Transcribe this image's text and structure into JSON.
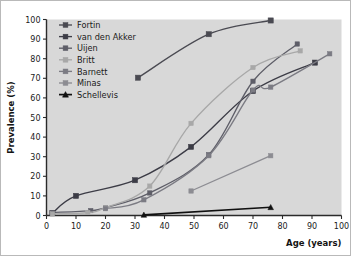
{
  "chart_data": {
    "type": "line",
    "title": "",
    "xlabel": "Age (years)",
    "ylabel": "Prevalence (%)",
    "xlim": [
      0,
      100
    ],
    "ylim": [
      0,
      100
    ],
    "xticks": [
      0,
      10,
      20,
      30,
      40,
      50,
      60,
      70,
      80,
      90,
      100
    ],
    "yticks": [
      0,
      10,
      20,
      30,
      40,
      50,
      60,
      70,
      80,
      90,
      100
    ],
    "grid": false,
    "legend_position": "top-left-inside",
    "plot_background": "#d8d8d8",
    "figure_background": "#ffffff",
    "series": [
      {
        "name": "Fortin",
        "color": "#4a4a52",
        "marker": "square",
        "points": [
          [
            31,
            70.3
          ],
          [
            55,
            92.5
          ],
          [
            76,
            99.5
          ]
        ]
      },
      {
        "name": "van den Akker",
        "color": "#3c3c46",
        "marker": "square",
        "points": [
          [
            2,
            1.2
          ],
          [
            10,
            10.0
          ],
          [
            30,
            18.0
          ],
          [
            49,
            35.0
          ],
          [
            70,
            63.5
          ],
          [
            91,
            78.0
          ]
        ]
      },
      {
        "name": "Uijen",
        "color": "#5e5e68",
        "marker": "square",
        "points": [
          [
            2,
            1.5
          ],
          [
            15,
            2.5
          ],
          [
            20,
            4.0
          ],
          [
            35,
            11.5
          ],
          [
            55,
            31.0
          ],
          [
            70,
            68.5
          ],
          [
            85,
            87.5
          ]
        ]
      },
      {
        "name": "Britt",
        "color": "#a8a8a8",
        "marker": "square",
        "points": [
          [
            2,
            0.8
          ],
          [
            14,
            1.5
          ],
          [
            20,
            4.0
          ],
          [
            35,
            15.0
          ],
          [
            49,
            47.0
          ],
          [
            70,
            75.5
          ],
          [
            86,
            84.0
          ]
        ]
      },
      {
        "name": "Barnett",
        "color": "#7b7b83",
        "marker": "square",
        "points": [
          [
            20,
            3.5
          ],
          [
            33,
            8.0
          ],
          [
            55,
            30.5
          ],
          [
            70,
            64.0
          ],
          [
            76,
            65.5
          ],
          [
            96,
            82.5
          ]
        ]
      },
      {
        "name": "Minas",
        "color": "#8c8c92",
        "marker": "square",
        "points": [
          [
            49,
            12.5
          ],
          [
            76,
            30.5
          ]
        ]
      },
      {
        "name": "Schellevis",
        "color": "#111111",
        "marker": "triangle",
        "points": [
          [
            33,
            0.3
          ],
          [
            76,
            4.2
          ]
        ]
      }
    ]
  },
  "legend": {
    "entries": [
      {
        "label": "Fortin"
      },
      {
        "label": "van den Akker"
      },
      {
        "label": "Uijen"
      },
      {
        "label": "Britt"
      },
      {
        "label": "Barnett"
      },
      {
        "label": "Minas"
      },
      {
        "label": "Schellevis"
      }
    ]
  }
}
